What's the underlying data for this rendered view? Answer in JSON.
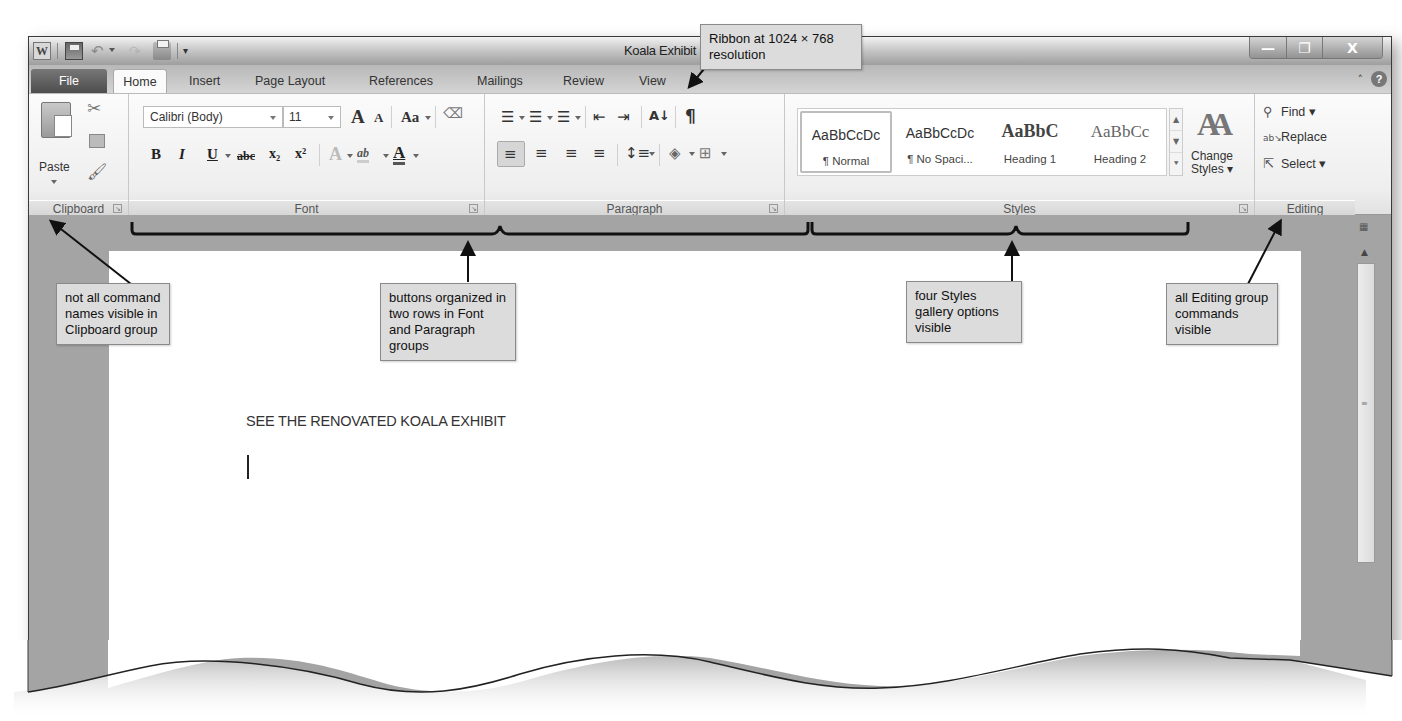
{
  "window": {
    "title": "Koala Exhibit",
    "app_icon": "W",
    "controls": {
      "minimize": "—",
      "restore": "❐",
      "close": "X"
    }
  },
  "quick_access_toolbar": {
    "items": [
      {
        "name": "save",
        "icon": "save-icon"
      },
      {
        "name": "undo",
        "icon": "undo-icon",
        "glyph": "↶"
      },
      {
        "name": "redo",
        "icon": "redo-icon",
        "glyph": "↷"
      },
      {
        "name": "quick-print",
        "icon": "print-icon"
      }
    ],
    "customize_glyph": "▾"
  },
  "tabs": [
    {
      "label": "File",
      "active": false
    },
    {
      "label": "Home",
      "active": true
    },
    {
      "label": "Insert",
      "active": false
    },
    {
      "label": "Page Layout",
      "active": false
    },
    {
      "label": "References",
      "active": false
    },
    {
      "label": "Mailings",
      "active": false
    },
    {
      "label": "Review",
      "active": false
    },
    {
      "label": "View",
      "active": false
    }
  ],
  "ribbon_right": {
    "minimize_glyph": "˄",
    "help_glyph": "?"
  },
  "ribbon": {
    "clipboard": {
      "label": "Clipboard",
      "paste_label": "Paste",
      "cut_glyph": "✂",
      "painter_glyph": "🖌"
    },
    "font": {
      "label": "Font",
      "font_name": "Calibri (Body)",
      "font_size": "11",
      "grow_font": "A",
      "shrink_font": "A",
      "change_case": "Aa",
      "clear_formatting": "ᴬᵇ",
      "bold": "B",
      "italic": "I",
      "underline": "U",
      "strikethrough": "abc",
      "subscript": "x₂",
      "superscript": "x²",
      "text_effects": "A",
      "highlight": "ab",
      "font_color": "A"
    },
    "paragraph": {
      "label": "Paragraph",
      "bullets": "☰",
      "numbering": "☰",
      "multilevel": "☰",
      "decrease_indent": "⇤",
      "increase_indent": "⇥",
      "sort": "A↓",
      "show_marks": "¶",
      "align_left": "≡",
      "center": "≡",
      "align_right": "≡",
      "justify": "≡",
      "line_spacing": "↕≡",
      "shading": "◈",
      "borders": "⊞"
    },
    "styles": {
      "label": "Styles",
      "gallery": [
        {
          "sample": "AaBbCcDc",
          "name": "¶ Normal",
          "selected": true
        },
        {
          "sample": "AaBbCcDc",
          "name": "¶ No Spaci...",
          "selected": false
        },
        {
          "sample": "AaBbC",
          "name": "Heading 1",
          "selected": false
        },
        {
          "sample": "AaBbCc",
          "name": "Heading 2",
          "selected": false
        }
      ],
      "change_styles_label_1": "Change",
      "change_styles_label_2": "Styles ▾",
      "change_styles_glyph": "AA"
    },
    "editing": {
      "label": "Editing",
      "find": "Find ▾",
      "replace": "Replace",
      "select": "Select ▾"
    }
  },
  "document": {
    "heading": "SEE THE RENOVATED KOALA EXHIBIT"
  },
  "callouts": {
    "ribbon_resolution": "Ribbon at 1024 × 768 resolution",
    "clipboard_note": "not all command names visible in Clipboard group",
    "font_para_note": "buttons organized in two rows in Font and Paragraph groups",
    "styles_note": "four Styles gallery options visible",
    "editing_note": "all Editing group commands visible"
  },
  "colors": {
    "callout_bg": "#dcdcdc",
    "callout_border": "#8a8a8a",
    "doc_bg": "#a4a4a4",
    "file_tab": "#555555"
  }
}
